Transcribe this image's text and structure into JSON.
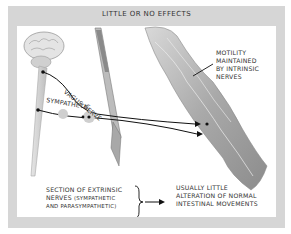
{
  "figure": {
    "title": "LITTLE OR NO EFFECTS",
    "labels": {
      "vagus": "VAGUS NERVE",
      "sympathetic": "SYMPATHETIC",
      "motility": [
        "MOTILITY",
        "MAINTAINED",
        "BY INTRINSIC",
        "NERVES"
      ],
      "section_line1_a": "SECTION OF EXTRINSIC",
      "section_line2_a": "NERVES ",
      "section_line2_b": "(SYMPATHETIC",
      "section_line3": "AND PARASYMPATHETIC)",
      "result": [
        "USUALLY LITTLE",
        "ALTERATION OF NORMAL",
        "INTESTINAL MOVEMENTS"
      ]
    },
    "colors": {
      "frame": "#d6d6d6",
      "panel": "#ffffff",
      "text": "#333333",
      "nerve": "#111111",
      "tissue": "#b8b8b8"
    }
  }
}
